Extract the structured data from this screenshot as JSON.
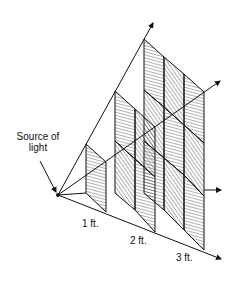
{
  "diagram": {
    "labels": {
      "source_line1": "Source of",
      "source_line2": "light",
      "distance_1": "1 ft.",
      "distance_2": "2 ft.",
      "distance_3": "3 ft."
    },
    "colors": {
      "line": "#111111",
      "background": "#ffffff"
    }
  }
}
